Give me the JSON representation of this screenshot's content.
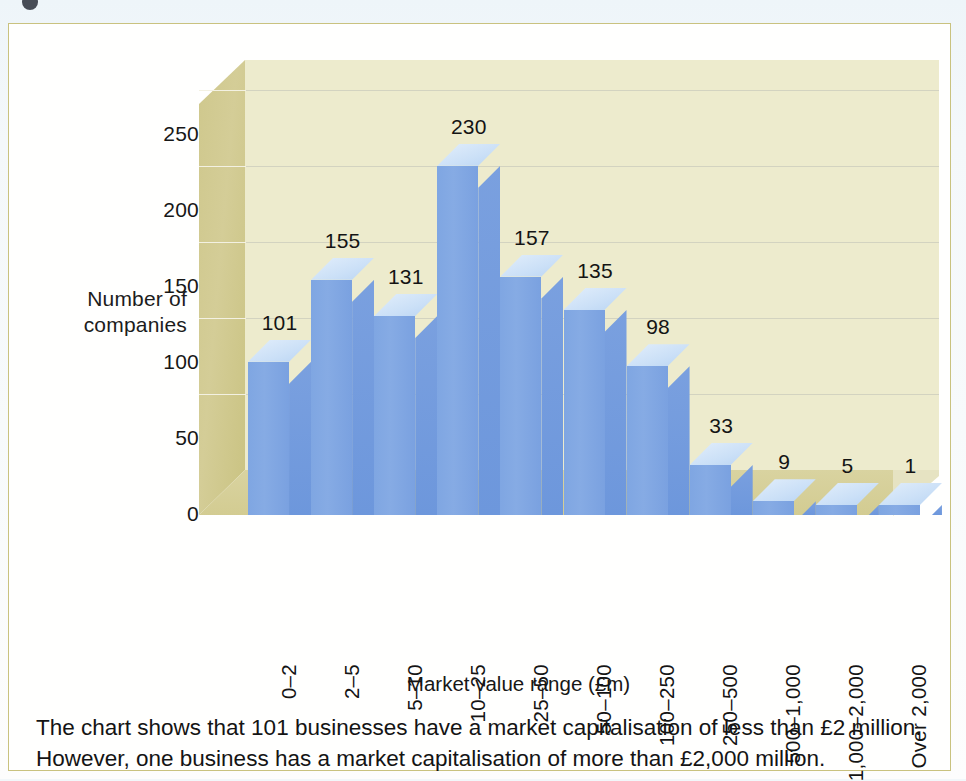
{
  "page": {
    "card_border_color": "#c9c27f",
    "background_color": "#f2f7fa"
  },
  "chart_data": {
    "type": "bar",
    "title": "",
    "subtitle": "",
    "xlabel": "Market value range (£m)",
    "ylabel": "Number of companies",
    "ylabel_lines": [
      "Number of",
      "companies"
    ],
    "categories": [
      "0–2",
      "2–5",
      "5–10",
      "10–25",
      "25–50",
      "50–100",
      "100–250",
      "250–500",
      "500–1,000",
      "1,000–2,000",
      "Over 2,000"
    ],
    "values": [
      101,
      155,
      131,
      230,
      157,
      135,
      98,
      33,
      9,
      5,
      1
    ],
    "data_labels": [
      "101",
      "155",
      "131",
      "230",
      "157",
      "135",
      "98",
      "33",
      "9",
      "5",
      "1"
    ],
    "yticks": [
      0,
      50,
      100,
      150,
      200,
      250
    ],
    "ytick_labels": [
      "0",
      "50",
      "100",
      "150",
      "200",
      "250"
    ],
    "ylim": [
      0,
      270
    ],
    "grid": true,
    "legend": "none",
    "style": "3d-column",
    "colors": {
      "bar_front": "#7fa6e2",
      "bar_top": "#cbe0f7",
      "bar_side": "#6d97dc",
      "back_wall": "#edebcd",
      "side_wall": "#cfc88d",
      "floor": "#d3cc92",
      "gridline": "#d3d3c0",
      "text": "#141414"
    }
  },
  "caption": {
    "line1": "The chart shows that 101 businesses have a market capitalisation of less than £2 million.",
    "line2": "However, one business has a market capitalisation of more than £2,000 million."
  }
}
